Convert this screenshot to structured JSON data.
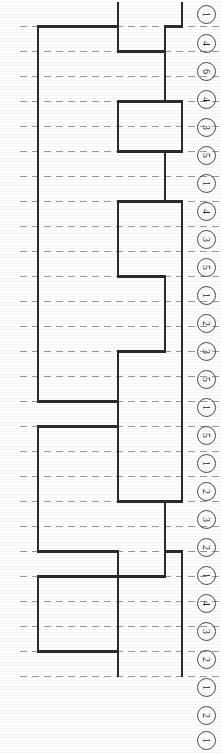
{
  "figure": {
    "type_hint": "rotated-step-chart",
    "orientation": "rotated-90-ccw",
    "background_color": "#fdfdfc",
    "line_color": "#2b2b2b",
    "grid_color": "#9a9a9a",
    "grid_style": "dashed",
    "width": 221,
    "height": 753
  },
  "rank_column": {
    "name": "circled-rank-values",
    "glyph_rotation_deg": 90,
    "items": [
      {
        "label": "1",
        "y": 14
      },
      {
        "label": "4",
        "y": 43
      },
      {
        "label": "6",
        "y": 71
      },
      {
        "label": "4",
        "y": 99
      },
      {
        "label": "3",
        "y": 127
      },
      {
        "label": "5",
        "y": 155
      },
      {
        "label": "1",
        "y": 183
      },
      {
        "label": "4",
        "y": 211
      },
      {
        "label": "3",
        "y": 239
      },
      {
        "label": "5",
        "y": 267
      },
      {
        "label": "1",
        "y": 295
      },
      {
        "label": "2",
        "y": 323
      },
      {
        "label": "3",
        "y": 351
      },
      {
        "label": "5",
        "y": 379
      },
      {
        "label": "1",
        "y": 407
      },
      {
        "label": "5",
        "y": 435
      },
      {
        "label": "1",
        "y": 463
      },
      {
        "label": "2",
        "y": 491
      },
      {
        "label": "3",
        "y": 519
      },
      {
        "label": "2",
        "y": 547
      },
      {
        "label": "1",
        "y": 575
      },
      {
        "label": "4",
        "y": 603
      },
      {
        "label": "3",
        "y": 631
      },
      {
        "label": "2",
        "y": 659
      },
      {
        "label": "1",
        "y": 687
      },
      {
        "label": "2",
        "y": 715
      },
      {
        "label": "1",
        "y": 740
      }
    ]
  },
  "chart_data": {
    "type": "bar",
    "title": "",
    "subtitle": "",
    "xlabel": "",
    "ylabel": "",
    "grid": true,
    "grid_orientation": "horizontal-dashed",
    "legend": "none",
    "orientation": "horizontal-rotated",
    "axis_note": "Values are encoded as horizontal pixel offsets of the stepped outline; baseline at x=38 for series A, x=118 for series B, x=165 for series C.",
    "categories": [
      "1",
      "4",
      "6",
      "4",
      "3",
      "5",
      "1",
      "4",
      "3",
      "5",
      "1",
      "2",
      "3",
      "5",
      "1",
      "5",
      "1",
      "2",
      "3",
      "2",
      "1",
      "4",
      "3",
      "2",
      "1",
      "2",
      "1"
    ],
    "row_pitch_px": 25,
    "first_row_center_y": 14,
    "series": [
      {
        "name": "series-A-left",
        "baseline_x": 38,
        "step_x": [
          118,
          38,
          38,
          38,
          38,
          38,
          38,
          38,
          38,
          38,
          38,
          38,
          38,
          38,
          38,
          38,
          118,
          38,
          38,
          38,
          38,
          38,
          118,
          38,
          38,
          38,
          118
        ],
        "values": [
          80,
          0,
          0,
          0,
          0,
          0,
          0,
          0,
          0,
          0,
          0,
          0,
          0,
          0,
          0,
          0,
          80,
          0,
          0,
          0,
          0,
          0,
          80,
          0,
          0,
          0,
          80
        ]
      },
      {
        "name": "series-B-middle",
        "baseline_x": 118,
        "step_x": [
          118,
          118,
          165,
          165,
          118,
          118,
          165,
          165,
          118,
          118,
          118,
          165,
          165,
          165,
          118,
          118,
          118,
          118,
          118,
          118,
          165,
          165,
          165,
          118,
          118,
          118,
          118
        ],
        "values": [
          0,
          0,
          47,
          47,
          0,
          0,
          47,
          47,
          0,
          0,
          0,
          47,
          47,
          47,
          0,
          0,
          0,
          0,
          0,
          0,
          47,
          47,
          47,
          0,
          0,
          0,
          0
        ]
      },
      {
        "name": "series-C-right",
        "baseline_x": 165,
        "step_x": [
          182,
          165,
          165,
          165,
          182,
          182,
          165,
          165,
          182,
          182,
          182,
          182,
          182,
          182,
          182,
          182,
          182,
          182,
          182,
          182,
          165,
          165,
          182,
          182,
          182,
          182,
          182
        ],
        "values": [
          17,
          0,
          0,
          0,
          17,
          17,
          0,
          0,
          17,
          17,
          17,
          17,
          17,
          17,
          17,
          17,
          17,
          17,
          17,
          17,
          0,
          0,
          17,
          17,
          17,
          17,
          17
        ]
      }
    ],
    "xlim": [
      0,
      195
    ],
    "ylim": [
      0,
      753
    ]
  }
}
